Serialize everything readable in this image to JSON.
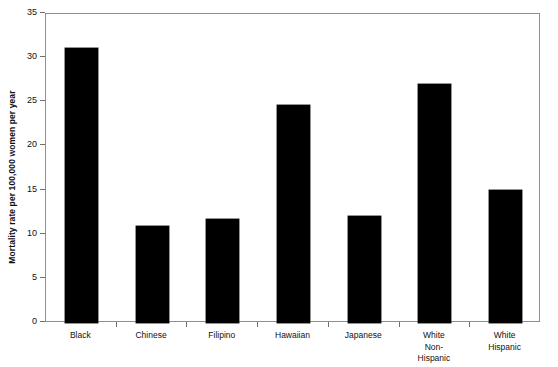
{
  "chart_data": {
    "type": "bar",
    "title": "",
    "xlabel": "",
    "ylabel": "Mortality rate per 100,000 women per year",
    "ylim": [
      0,
      35
    ],
    "ytick_labels": [
      "0",
      "5",
      "10",
      "15",
      "20",
      "25",
      "30",
      "35"
    ],
    "ytick_values": [
      0,
      5,
      10,
      15,
      20,
      25,
      30,
      35
    ],
    "grid": false,
    "legend": "none",
    "bar_color": "#000000",
    "frame_color": "#8f8f8f",
    "categories": [
      "Black",
      "Chinese",
      "Filipino",
      "Hawaiian",
      "Japanese",
      "White\nNon-\nHispanic",
      "White\nHispanic"
    ],
    "values": [
      31.2,
      11.0,
      11.8,
      24.7,
      12.1,
      27.1,
      15.1
    ]
  }
}
